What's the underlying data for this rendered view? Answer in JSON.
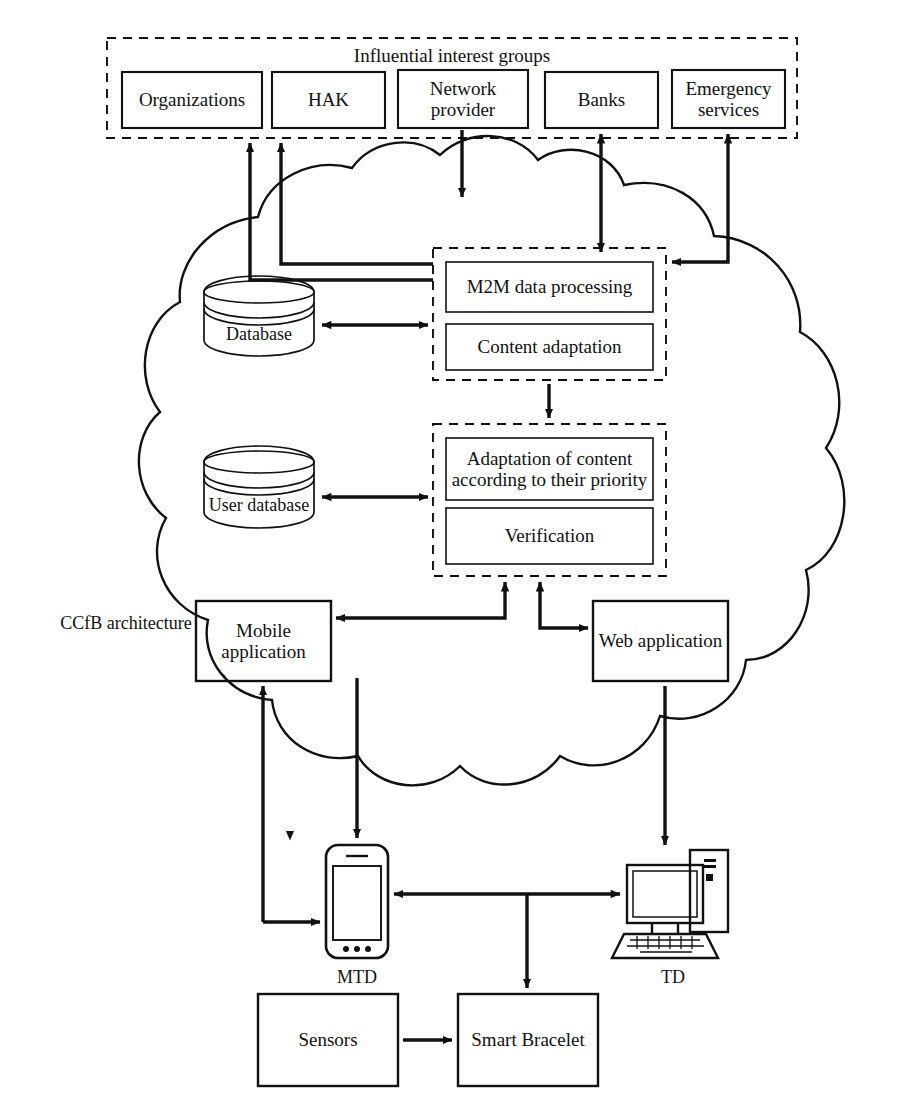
{
  "diagram": {
    "colors": {
      "stroke": "#111111",
      "background": "#ffffff",
      "fill": "#ffffff"
    }
  },
  "interest_groups": {
    "title": "Influential interest groups",
    "members": [
      {
        "label": "Organizations"
      },
      {
        "label": "HAK"
      },
      {
        "label": "Network provider"
      },
      {
        "label": "Banks"
      },
      {
        "label": "Emergency services"
      }
    ]
  },
  "cloud": {
    "label": "CCfB architecture"
  },
  "databases": [
    {
      "label": "Database"
    },
    {
      "label": "User database"
    }
  ],
  "processing_group": {
    "items": [
      {
        "label": "M2M data processing"
      },
      {
        "label": "Content adaptation"
      }
    ]
  },
  "adaptation_group": {
    "items": [
      {
        "label": "Adaptation of content according to their priority"
      },
      {
        "label": "Verification"
      }
    ]
  },
  "applications": [
    {
      "label": "Mobile application"
    },
    {
      "label": "Web application"
    }
  ],
  "devices": [
    {
      "label": "MTD",
      "icon": "smartphone-icon"
    },
    {
      "label": "TD",
      "icon": "desktop-computer-icon"
    }
  ],
  "endpoints": [
    {
      "label": "Sensors"
    },
    {
      "label": "Smart Bracelet"
    }
  ]
}
